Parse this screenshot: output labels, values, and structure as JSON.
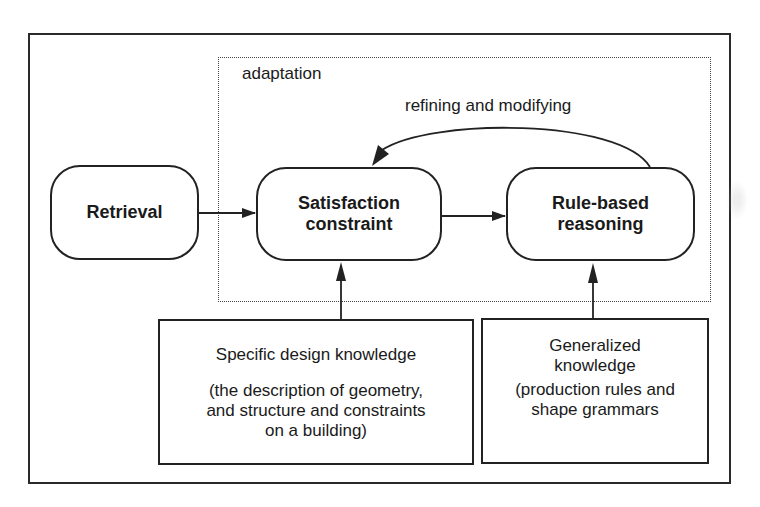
{
  "diagram": {
    "adaptation_label": "adaptation",
    "loop_label": "refining and modifying",
    "nodes": {
      "retrieval": "Retrieval",
      "satisfaction": [
        "Satisfaction",
        "constraint"
      ],
      "rule_based": [
        "Rule-based",
        "reasoning"
      ]
    },
    "knowledge": {
      "specific": {
        "title": "Specific design knowledge",
        "description": [
          "(the description of geometry,",
          "and structure and constraints",
          "on a building)"
        ]
      },
      "generalized": {
        "title": [
          "Generalized",
          "knowledge"
        ],
        "description": [
          "(production rules and",
          "shape grammars"
        ]
      }
    },
    "edges": [
      {
        "from": "Retrieval",
        "to": "Satisfaction constraint"
      },
      {
        "from": "Satisfaction constraint",
        "to": "Rule-based reasoning"
      },
      {
        "from": "Rule-based reasoning",
        "to": "Satisfaction constraint",
        "label": "refining and modifying"
      },
      {
        "from": "Specific design knowledge",
        "to": "Satisfaction constraint"
      },
      {
        "from": "Generalized knowledge",
        "to": "Rule-based reasoning"
      }
    ],
    "colors": {
      "line": "#222222",
      "background": "#ffffff"
    }
  }
}
